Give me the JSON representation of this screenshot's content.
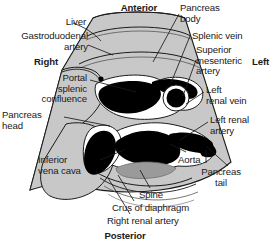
{
  "figure": {
    "orientation": {
      "anterior": "Anterior",
      "posterior": "Posterior",
      "right": "Right",
      "left": "Left"
    },
    "colors": {
      "background": "#ffffff",
      "soft_tissue": "#c8c8c8",
      "soft_tissue_dark": "#b4b4b4",
      "vessel_lumen": "#000000",
      "vessel_wall": "#ffffff",
      "organ_fill": "#cfcfcf",
      "spine_fill": "#9a9a9a",
      "outline": "#1a1a1a",
      "label_text": "#1a1a1a"
    },
    "labels": [
      {
        "id": "anterior",
        "text": "Anterior",
        "x": 106,
        "y": 3,
        "bold": true,
        "align": "center",
        "width": 66
      },
      {
        "id": "liver",
        "text": "Liver",
        "x": 44,
        "y": 17,
        "bold": false,
        "align": "right",
        "width": 42
      },
      {
        "id": "gastroduodenal-artery",
        "text": "Gastroduodenal\nartery",
        "x": 4,
        "y": 31,
        "bold": false,
        "align": "right",
        "width": 84
      },
      {
        "id": "right",
        "text": "Right",
        "x": 34,
        "y": 57,
        "bold": true,
        "align": "left",
        "width": 40
      },
      {
        "id": "portal-splenic-confluence",
        "text": "Portal\nsplenic\nconfluence",
        "x": 5,
        "y": 73,
        "bold": false,
        "align": "right",
        "width": 82
      },
      {
        "id": "pancreas-head",
        "text": "Pancreas\nhead",
        "x": 2,
        "y": 110,
        "bold": false,
        "align": "left",
        "width": 60
      },
      {
        "id": "inferior-vena-cava",
        "text": "Inferior\nvena cava",
        "x": 38,
        "y": 155,
        "bold": false,
        "align": "left",
        "width": 66
      },
      {
        "id": "pancreas-body",
        "text": "Pancreas\nbody",
        "x": 180,
        "y": 3,
        "bold": false,
        "align": "left",
        "width": 62
      },
      {
        "id": "splenic-vein",
        "text": "Splenic vein",
        "x": 192,
        "y": 31,
        "bold": false,
        "align": "left",
        "width": 76
      },
      {
        "id": "superior-mesenteric-artery",
        "text": "Superior\nmesenteric\nartery",
        "x": 196,
        "y": 45,
        "bold": false,
        "align": "left",
        "width": 66
      },
      {
        "id": "left",
        "text": "Left",
        "x": 252,
        "y": 57,
        "bold": true,
        "align": "left",
        "width": 26
      },
      {
        "id": "left-renal-vein",
        "text": "Left\nrenal vein",
        "x": 206,
        "y": 85,
        "bold": false,
        "align": "left",
        "width": 64
      },
      {
        "id": "left-renal-artery",
        "text": "Left renal\nartery",
        "x": 210,
        "y": 115,
        "bold": false,
        "align": "left",
        "width": 64
      },
      {
        "id": "aorta",
        "text": "Aorta",
        "x": 178,
        "y": 155,
        "bold": false,
        "align": "left",
        "width": 40
      },
      {
        "id": "pancreas-tail",
        "text": "Pancreas\ntail",
        "x": 190,
        "y": 167,
        "bold": false,
        "align": "center",
        "width": 62
      },
      {
        "id": "spine",
        "text": "Spine",
        "x": 139,
        "y": 190,
        "bold": false,
        "align": "left",
        "width": 40
      },
      {
        "id": "crus-of-diaphragm",
        "text": "Crus of diaphragm",
        "x": 112,
        "y": 203,
        "bold": false,
        "align": "left",
        "width": 106
      },
      {
        "id": "right-renal-artery",
        "text": "Right renal artery",
        "x": 107,
        "y": 216,
        "bold": false,
        "align": "left",
        "width": 104
      },
      {
        "id": "posterior",
        "text": "Posterior",
        "x": 92,
        "y": 231,
        "bold": true,
        "align": "center",
        "width": 66
      }
    ],
    "structures": [
      {
        "id": "sector-field",
        "name": "ultrasound-sector-field",
        "fill": "#c8c8c8"
      },
      {
        "id": "near-field-arc-1",
        "name": "near-field-band-1",
        "fill": "#c8c8c8"
      },
      {
        "id": "near-field-arc-2",
        "name": "near-field-band-2",
        "fill": "#c8c8c8"
      },
      {
        "id": "liver-region",
        "name": "liver",
        "fill": "#c8c8c8"
      },
      {
        "id": "pancreas-head-region",
        "name": "pancreas-head",
        "fill": "#c8c8c8"
      },
      {
        "id": "ivc-lumen",
        "name": "inferior-vena-cava",
        "fill": "#000000"
      },
      {
        "id": "psc-lumen",
        "name": "portal-splenic-confluence",
        "fill": "#000000"
      },
      {
        "id": "sma-lumen",
        "name": "superior-mesenteric-artery",
        "fill": "#000000"
      },
      {
        "id": "aorta-lumen",
        "name": "aorta",
        "fill": "#000000"
      },
      {
        "id": "lrv-lumen",
        "name": "left-renal-vein",
        "fill": "#000000"
      },
      {
        "id": "spine-body",
        "name": "vertebral-body",
        "fill": "#9a9a9a"
      },
      {
        "id": "gda-dot",
        "name": "gastroduodenal-artery",
        "fill": "#000000"
      }
    ],
    "leaders": [
      {
        "id": "leader-liver",
        "to": "liver"
      },
      {
        "id": "leader-gda",
        "to": "gastroduodenal-artery"
      },
      {
        "id": "leader-psc",
        "to": "portal-splenic-confluence"
      },
      {
        "id": "leader-pancreas-head",
        "to": "pancreas-head"
      },
      {
        "id": "leader-ivc",
        "to": "inferior-vena-cava"
      },
      {
        "id": "leader-pancreas-body",
        "to": "pancreas-body"
      },
      {
        "id": "leader-splenic-vein",
        "to": "splenic-vein"
      },
      {
        "id": "leader-sma",
        "to": "superior-mesenteric-artery"
      },
      {
        "id": "leader-lrv",
        "to": "left-renal-vein"
      },
      {
        "id": "leader-lra",
        "to": "left-renal-artery"
      },
      {
        "id": "leader-aorta",
        "to": "aorta"
      },
      {
        "id": "leader-pancreas-tail",
        "to": "pancreas-tail"
      },
      {
        "id": "leader-spine",
        "to": "spine"
      },
      {
        "id": "leader-crus",
        "to": "crus-of-diaphragm"
      },
      {
        "id": "leader-rra",
        "to": "right-renal-artery"
      }
    ]
  }
}
